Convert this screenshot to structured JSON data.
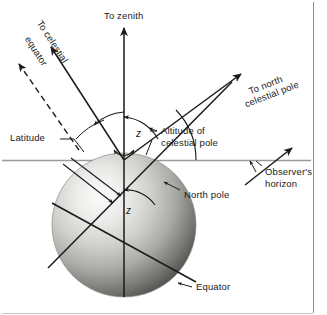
{
  "figure": {
    "type": "diagram",
    "background_color": "#ffffff",
    "line_color": "#1a1a1a",
    "sphere": {
      "name": "earth-sphere",
      "center_x": 124,
      "center_y": 225,
      "radius": 72,
      "highlight_color": "#f4f4f2",
      "midtone_color": "#b9b9b6",
      "shadow_color": "#4e4e4c",
      "highlight_offset_x": -26,
      "highlight_offset_y": -30
    },
    "horizon": {
      "y": 160,
      "x_start": 2,
      "x_end": 311,
      "color": "#9a9a9a"
    },
    "origin": {
      "x": 124,
      "y": 160
    }
  },
  "labels": {
    "to_zenith": "To zenith",
    "to_celestial_equator": "To celestial\nequator",
    "to_celestial_equator_line1": "To celestial",
    "to_celestial_equator_line2": "equator",
    "to_north_celestial_pole_line1": "To north",
    "to_north_celestial_pole_line2": "celestial pole",
    "latitude": "Latitude",
    "altitude_of_celestial_pole_line1": "Altitude of",
    "altitude_of_celestial_pole_line2": "celestial pole",
    "observers_horizon_line1": "Observer's",
    "observers_horizon_line2": "horizon",
    "north_pole": "North pole",
    "equator": "Equator",
    "zenith_angle_upper": "z",
    "zenith_angle_lower": "z"
  },
  "angles": {
    "zenith_distance_symbol": "z",
    "description": "The angle z between the local vertical (zenith) and the direction to the north celestial pole equals the angle z at the Earth's centre between the vertical and the polar axis; the altitude of the celestial pole equals the observer's latitude."
  },
  "annotations": [
    {
      "name": "to-zenith-arrow",
      "direction": "up",
      "from": [
        124,
        160
      ],
      "to": [
        124,
        27
      ]
    },
    {
      "name": "to-celestial-equator-arrow",
      "direction": "upper-left",
      "from": [
        124,
        160
      ],
      "to": [
        52,
        48
      ]
    },
    {
      "name": "to-celestial-equator-dashed-arrow",
      "direction": "upper-left",
      "from": [
        78,
        148
      ],
      "to": [
        20,
        66
      ]
    },
    {
      "name": "to-north-celestial-pole-arrow",
      "direction": "upper-right",
      "from": [
        124,
        160
      ],
      "to": [
        240,
        75
      ]
    },
    {
      "name": "polar-axis-line",
      "direction": "lower-left to upper-right",
      "from": [
        48,
        268
      ],
      "to": [
        240,
        75
      ]
    },
    {
      "name": "equator-plane-line",
      "direction": "upper-left to lower-right",
      "from": [
        52,
        203
      ],
      "to": [
        196,
        282
      ]
    },
    {
      "name": "vertical-axis-line",
      "from": [
        124,
        27
      ],
      "to": [
        124,
        297
      ]
    }
  ]
}
